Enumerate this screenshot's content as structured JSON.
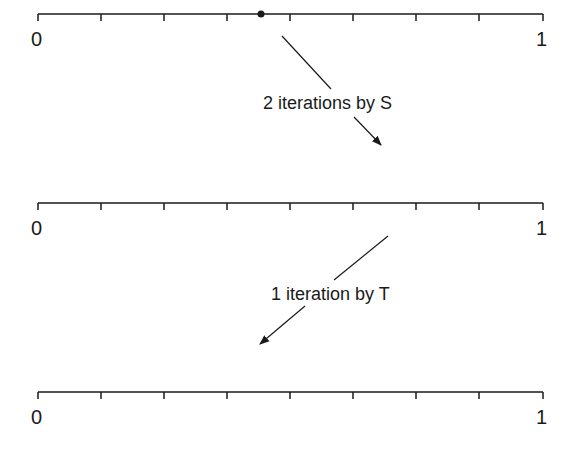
{
  "diagram": {
    "number_lines": [
      {
        "id": "top",
        "start_label": "0",
        "end_label": "1",
        "divisions": 8,
        "marked_point": 0.353
      },
      {
        "id": "middle",
        "start_label": "0",
        "end_label": "1",
        "divisions": 8
      },
      {
        "id": "bottom",
        "start_label": "0",
        "end_label": "1",
        "divisions": 8
      }
    ],
    "arrows": [
      {
        "label": "2 iterations by S",
        "from": "top",
        "to": "middle",
        "direction": "down-right"
      },
      {
        "label": "1 iteration by T",
        "from": "middle",
        "to": "bottom",
        "direction": "down-left"
      }
    ],
    "colors": {
      "line": "#1a1a1a",
      "background": "#ffffff"
    }
  }
}
